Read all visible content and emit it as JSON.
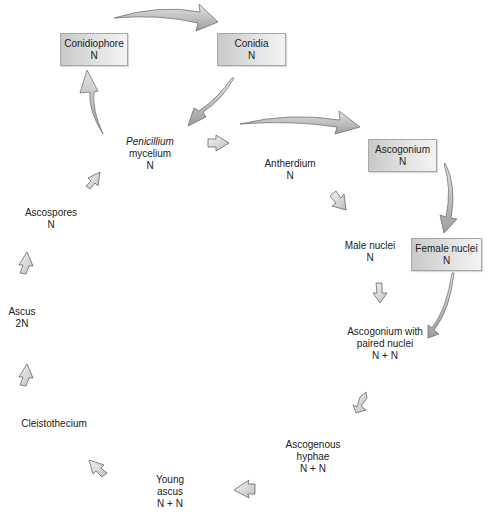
{
  "diagram": {
    "type": "life-cycle",
    "nodes": [
      {
        "id": "conidiophore",
        "name": "Conidiophore",
        "ploidy": "N",
        "boxed": true
      },
      {
        "id": "conidia",
        "name": "Conidia",
        "ploidy": "N",
        "boxed": true
      },
      {
        "id": "mycelium",
        "name_italic": "Penicillium",
        "name": "mycelium",
        "ploidy": "N",
        "boxed": false
      },
      {
        "id": "antherdium",
        "name": "Antherdium",
        "ploidy": "N",
        "boxed": false
      },
      {
        "id": "ascogonium",
        "name": "Ascogonium",
        "ploidy": "N",
        "boxed": true
      },
      {
        "id": "male-nuclei",
        "name": "Male nuclei",
        "ploidy": "N",
        "boxed": false
      },
      {
        "id": "female-nuclei",
        "name": "Female nuclei",
        "ploidy": "N",
        "boxed": true
      },
      {
        "id": "paired",
        "name_line1": "Ascogonium with",
        "name_line2": "paired nuclei",
        "ploidy": "N + N",
        "boxed": false
      },
      {
        "id": "ascogenous",
        "name_line1": "Ascogenous",
        "name_line2": "hyphae",
        "ploidy": "N + N",
        "boxed": false
      },
      {
        "id": "young-ascus",
        "name_line1": "Young",
        "name_line2": "ascus",
        "ploidy": "N + N",
        "boxed": false
      },
      {
        "id": "cleistothecium",
        "name": "Cleistothecium",
        "boxed": false
      },
      {
        "id": "ascus",
        "name": "Ascus",
        "ploidy": "2N",
        "boxed": false
      },
      {
        "id": "ascospores",
        "name": "Ascospores",
        "ploidy": "N",
        "boxed": false
      }
    ],
    "edges": [
      [
        "conidiophore",
        "conidia"
      ],
      [
        "conidia",
        "mycelium"
      ],
      [
        "mycelium",
        "conidiophore"
      ],
      [
        "mycelium",
        "antherdium"
      ],
      [
        "mycelium",
        "ascogonium"
      ],
      [
        "antherdium",
        "male-nuclei"
      ],
      [
        "ascogonium",
        "female-nuclei"
      ],
      [
        "male-nuclei",
        "paired"
      ],
      [
        "female-nuclei",
        "paired"
      ],
      [
        "paired",
        "ascogenous"
      ],
      [
        "ascogenous",
        "young-ascus"
      ],
      [
        "young-ascus",
        "cleistothecium"
      ],
      [
        "cleistothecium",
        "ascus"
      ],
      [
        "ascus",
        "ascospores"
      ],
      [
        "ascospores",
        "mycelium"
      ]
    ],
    "colors": {
      "box_fill": "#dcdcdc",
      "box_border": "#a8a8a8",
      "arrow_fill": "#b8b8b8",
      "arrow_stroke": "#555555",
      "text": "#222222"
    }
  }
}
